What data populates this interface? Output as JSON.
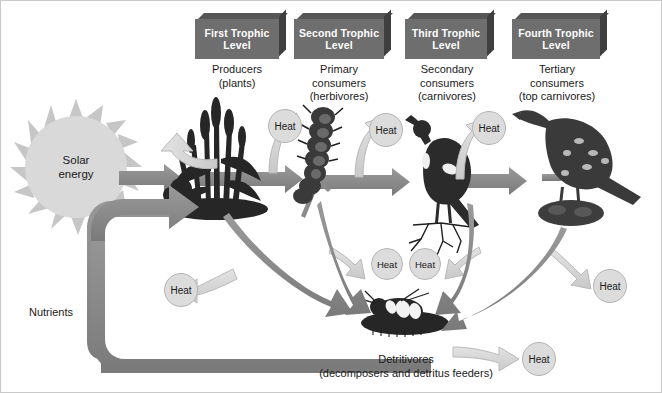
{
  "diagram": {
    "background": "#ffffff",
    "colors": {
      "block_face": "#6e6e6e",
      "block_side": "#3f3f3f",
      "energy_arrow": "#8a8a8a",
      "heat_arrow": "#d2d2d2",
      "heat_bubble": "#dcdcdc",
      "sun": "#d9d9d9",
      "organism": "#2e2e2e"
    }
  },
  "trophic_levels": [
    {
      "block_label_line1": "First Trophic",
      "block_label_line2": "Level",
      "caption_line1": "Producers",
      "caption_line2": "(plants)",
      "caption_line3": "",
      "organism": "grass-plants"
    },
    {
      "block_label_line1": "Second Trophic",
      "block_label_line2": "Level",
      "caption_line1": "Primary",
      "caption_line2": "consumers",
      "caption_line3": "(herbivores)",
      "organism": "caterpillar"
    },
    {
      "block_label_line1": "Third Trophic",
      "block_label_line2": "Level",
      "caption_line1": "Secondary",
      "caption_line2": "consumers",
      "caption_line3": "(carnivores)",
      "organism": "songbird"
    },
    {
      "block_label_line1": "Fourth Trophic",
      "block_label_line2": "Level",
      "caption_line1": "Tertiary",
      "caption_line2": "consumers",
      "caption_line3": "(top carnivores)",
      "organism": "hawk"
    }
  ],
  "sun": {
    "label_line1": "Solar",
    "label_line2": "energy"
  },
  "nutrients": {
    "label": "Nutrients"
  },
  "detritivores": {
    "label_line1": "Detritivores",
    "label_line2": "(decomposers and detritus feeders)"
  },
  "heat_labels": {
    "producers_up": "Heat",
    "herbivores_up": "Heat",
    "carnivores_up": "Heat",
    "topcarnivores_up": "Heat",
    "nutrients_left": "Heat",
    "center_left": "Heat",
    "center_right": "Heat",
    "right_lower": "Heat",
    "detritivores_right": "Heat"
  }
}
